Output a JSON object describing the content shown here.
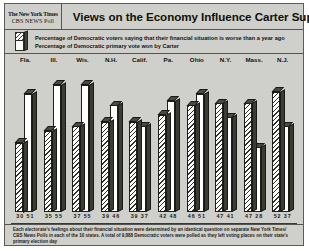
{
  "header": {
    "logo_line1": "The New York Times",
    "logo_line2": "CBS NEWS Poll",
    "title": "Views on the Economy Influence Carter Support"
  },
  "legend": {
    "series1_label": "Percentage of Democratic voters saying that their financial situation is worse than a year ago",
    "series2_label": "Percentage of Democratic primary vote won by Carter"
  },
  "footnote": {
    "text": "Each electorate's feelings about their financial situation were determined by an identical question on separate New York Times/ CBS News Polls in each of the 10 states. A total of 9,888 Democratic voters were polled as they left voting places on their state's primary election day"
  },
  "value_labels": [
    "30  51",
    "35  55",
    "37  55",
    "39  46",
    "39  37",
    "42  48",
    "46  51",
    "47  41",
    "47  28",
    "52  37"
  ],
  "colors": {
    "background": "#cfcfcb",
    "border": "#55554f",
    "bar_side": "#3c3c35",
    "hatch_dark": "#33332c",
    "bar_white": "#ffffff"
  },
  "chart_data": {
    "type": "bar",
    "title": "Views on the Economy Influence Carter Support",
    "xlabel": "",
    "ylabel": "Percent",
    "ylim": [
      0,
      60
    ],
    "grid": false,
    "legend_position": "top",
    "categories": [
      "Fla.",
      "Ill.",
      "Wis.",
      "N.H.",
      "Calif.",
      "Pa.",
      "Ohio",
      "N.Y.",
      "Mass.",
      "N.J."
    ],
    "series": [
      {
        "name": "Percentage of Democratic voters saying that their financial situation is worse than a year ago",
        "values": [
          30,
          35,
          37,
          39,
          39,
          42,
          46,
          47,
          47,
          52
        ]
      },
      {
        "name": "Percentage of Democratic primary vote won by Carter",
        "values": [
          51,
          55,
          55,
          46,
          37,
          48,
          51,
          41,
          28,
          37
        ]
      }
    ]
  }
}
